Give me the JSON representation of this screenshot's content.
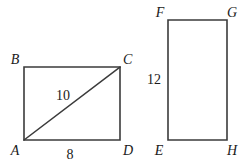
{
  "figure": {
    "background_color": "#ffffff",
    "stroke_color": "#3b3b3b",
    "text_color": "#1a1a1a",
    "shapes": [
      {
        "name": "rectangle-abcd",
        "kind": "rectangle-with-diagonal",
        "vertices": [
          {
            "label": "B",
            "x": 24,
            "y": 67,
            "label_x": 15,
            "label_y": 64
          },
          {
            "label": "C",
            "x": 120,
            "y": 67,
            "label_x": 123,
            "label_y": 64
          },
          {
            "label": "D",
            "x": 120,
            "y": 140,
            "label_x": 123,
            "label_y": 155
          },
          {
            "label": "A",
            "x": 24,
            "y": 140,
            "label_x": 13,
            "label_y": 155
          }
        ],
        "diagonal": {
          "from": "A",
          "to": "C",
          "length_label": "10",
          "label_x": 56,
          "label_y": 100
        },
        "side_labels": [
          {
            "text": "8",
            "for_side": "AD",
            "x": 68,
            "label_y": 158
          }
        ]
      },
      {
        "name": "rectangle-efgh",
        "kind": "rectangle",
        "vertices": [
          {
            "label": "F",
            "x": 168,
            "y": 20,
            "label_x": 159,
            "label_y": 17
          },
          {
            "label": "G",
            "x": 227,
            "y": 20,
            "label_x": 230,
            "label_y": 17
          },
          {
            "label": "H",
            "x": 227,
            "y": 140,
            "label_x": 230,
            "label_y": 155
          },
          {
            "label": "E",
            "x": 168,
            "y": 140,
            "label_x": 157,
            "label_y": 155
          }
        ],
        "side_labels": [
          {
            "text": "12",
            "for_side": "EF",
            "x": 146,
            "label_y": 84
          }
        ]
      }
    ]
  }
}
